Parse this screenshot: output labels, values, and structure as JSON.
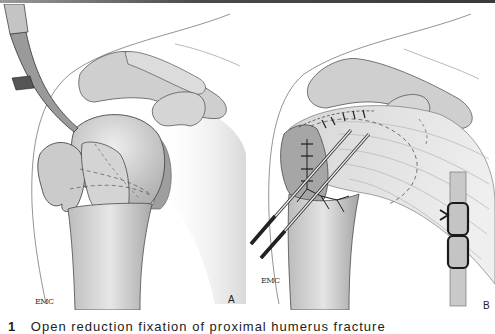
{
  "figure": {
    "panels": [
      {
        "label": "A",
        "signature": "EMC",
        "description": "Proximal humerus fracture with elevator reducing head fragment; dashed fracture lines"
      },
      {
        "label": "B",
        "signature": "EMC",
        "description": "Repair with two percutaneous pins and sutured rotator cuff; inset of suture knot on strip"
      }
    ],
    "caption": {
      "number": "1",
      "text": "Open reduction fixation of proximal humerus fracture"
    },
    "colors": {
      "bone_fill": "#d8d8d8",
      "bone_shade": "#a8a8a8",
      "outline": "#4a4a4a",
      "suture": "#1e1e1e",
      "inset_strip": "#c9c9c9"
    }
  }
}
